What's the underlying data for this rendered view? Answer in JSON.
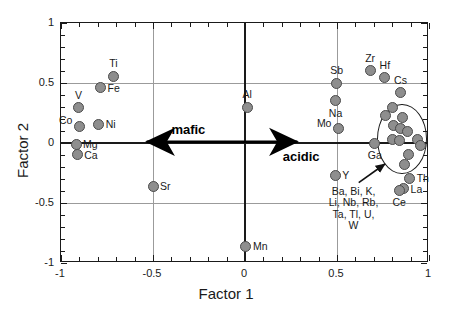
{
  "chart_data": {
    "type": "scatter",
    "title": "",
    "xlabel": "Factor 1",
    "ylabel": "Factor 2",
    "xlim": [
      -1,
      1
    ],
    "ylim": [
      -1,
      1
    ],
    "xticks": [
      "-1",
      "-0.5",
      "0",
      "0.5",
      "1"
    ],
    "xtick_values": [
      -1,
      -0.5,
      0,
      0.5,
      1
    ],
    "yticks": [
      "-1",
      "-0.5",
      "0",
      "0.5",
      "1"
    ],
    "ytick_values": [
      -1,
      -0.5,
      0,
      0.5,
      1
    ],
    "grid": true,
    "legend": "none",
    "points": [
      {
        "label": "Ti",
        "x": -0.715,
        "y": 0.555,
        "label_pos": "above"
      },
      {
        "label": "Fe",
        "x": -0.785,
        "y": 0.462,
        "label_pos": "right"
      },
      {
        "label": "V",
        "x": -0.905,
        "y": 0.295,
        "label_pos": "above"
      },
      {
        "label": "Ni",
        "x": -0.795,
        "y": 0.155,
        "label_pos": "right"
      },
      {
        "label": "Co",
        "x": -0.9,
        "y": 0.14,
        "label_pos": "left"
      },
      {
        "label": "Mg",
        "x": -0.918,
        "y": -0.01,
        "label_pos": "right"
      },
      {
        "label": "Ca",
        "x": -0.912,
        "y": -0.098,
        "label_pos": "right"
      },
      {
        "label": "Sr",
        "x": -0.5,
        "y": -0.362,
        "label_pos": "right"
      },
      {
        "label": "Mn",
        "x": 0.005,
        "y": -0.862,
        "label_pos": "right"
      },
      {
        "label": "Al",
        "x": 0.012,
        "y": 0.298,
        "label_pos": "above"
      },
      {
        "label": "Sb",
        "x": 0.498,
        "y": 0.5,
        "label_pos": "above"
      },
      {
        "label": "Na",
        "x": 0.492,
        "y": 0.352,
        "label_pos": "below"
      },
      {
        "label": "Mo",
        "x": 0.508,
        "y": 0.118,
        "label_pos": "left"
      },
      {
        "label": "Y",
        "x": 0.49,
        "y": -0.268,
        "label_pos": "right"
      },
      {
        "label": "Zr",
        "x": 0.68,
        "y": 0.602,
        "label_pos": "above"
      },
      {
        "label": "Hf",
        "x": 0.76,
        "y": 0.545,
        "label_pos": "above"
      },
      {
        "label": "Cs",
        "x": 0.845,
        "y": 0.42,
        "label_pos": "above"
      },
      {
        "label": "Ga",
        "x": 0.705,
        "y": 0.0,
        "label_pos": "below"
      },
      {
        "label": "Th",
        "x": 0.895,
        "y": -0.295,
        "label_pos": "right"
      },
      {
        "label": "La",
        "x": 0.862,
        "y": -0.382,
        "label_pos": "right"
      },
      {
        "label": "Ce",
        "x": 0.838,
        "y": -0.392,
        "label_pos": "below"
      }
    ],
    "cluster_points": [
      {
        "x": 0.8,
        "y": 0.292
      },
      {
        "x": 0.765,
        "y": 0.232
      },
      {
        "x": 0.855,
        "y": 0.215
      },
      {
        "x": 0.805,
        "y": 0.145
      },
      {
        "x": 0.845,
        "y": 0.125
      },
      {
        "x": 0.885,
        "y": 0.092
      },
      {
        "x": 0.8,
        "y": 0.03
      },
      {
        "x": 0.838,
        "y": 0.022
      },
      {
        "x": 0.94,
        "y": 0.03
      },
      {
        "x": 0.955,
        "y": -0.022
      },
      {
        "x": 0.89,
        "y": -0.095
      },
      {
        "x": 0.868,
        "y": -0.175
      }
    ],
    "cluster_ellipse": {
      "cx": 0.855,
      "cy": 0.035,
      "rx": 0.135,
      "ry": 0.29
    },
    "cluster_annotation": [
      "Ba, Bi, K,",
      "Li, Nb, Rb,",
      "Ta, Tl, U,",
      "W"
    ],
    "cluster_annotation_elements": [
      "Ba",
      "Bi",
      "K",
      "Li",
      "Nb",
      "Rb",
      "Ta",
      "Tl",
      "U",
      "W"
    ],
    "annotations": [
      {
        "text": "mafic",
        "x": -0.4,
        "y": 0.11
      },
      {
        "text": "acidic",
        "x": 0.205,
        "y": -0.115
      }
    ],
    "trend_arrow": {
      "from_x": -0.6,
      "to_x": 0.35,
      "y": 0.01,
      "double_headed": true
    },
    "colors": {
      "marker_fill": "#8e8e8e",
      "marker_edge": "#4a4a4a",
      "grid": "#9b9b9b",
      "axis": "#1a1a1a",
      "text": "#1a1a1a",
      "background": "#ffffff"
    }
  }
}
